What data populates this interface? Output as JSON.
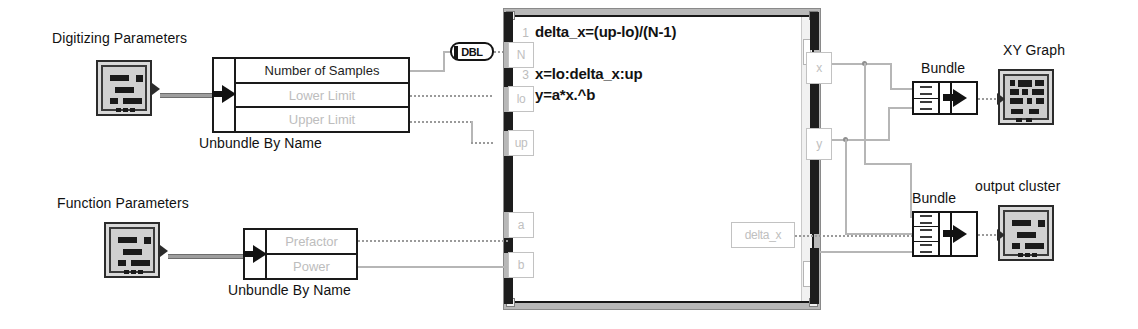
{
  "diagram": {
    "labels": {
      "digitizing_parameters": "Digitizing Parameters",
      "function_parameters": "Function Parameters",
      "unbundle_by_name_1": "Unbundle By Name",
      "unbundle_by_name_2": "Unbundle By Name",
      "bundle_1": "Bundle",
      "bundle_2": "Bundle",
      "xy_graph": "XY Graph",
      "output_cluster": "output cluster"
    },
    "unbundle_top": {
      "items": [
        {
          "label": "Number of Samples",
          "style": "dark"
        },
        {
          "label": "Lower Limit",
          "style": "faint"
        },
        {
          "label": "Upper Limit",
          "style": "faint"
        }
      ]
    },
    "unbundle_bottom": {
      "items": [
        {
          "label": "Prefactor",
          "style": "faint"
        },
        {
          "label": "Power",
          "style": "faint"
        }
      ]
    },
    "conversion_node": {
      "label": "DBL"
    },
    "formula_node": {
      "lines": [
        {
          "num": "1",
          "code": "delta_x=(up-lo)/(N-1)"
        },
        {
          "num": "2",
          "code": ""
        },
        {
          "num": "3",
          "code": "x=lo:delta_x:up"
        },
        {
          "num": "4",
          "code": "y=a*x.^b"
        }
      ],
      "inputs": [
        {
          "name": "N"
        },
        {
          "name": "lo"
        },
        {
          "name": "up"
        },
        {
          "name": "a"
        },
        {
          "name": "b"
        }
      ],
      "outputs": [
        {
          "name": "x"
        },
        {
          "name": "y"
        },
        {
          "name": "delta_x"
        }
      ]
    },
    "colors": {
      "wire": "#b6b6b6",
      "node_border": "#141414",
      "faint_text": "#bdbdbd",
      "frame": "#b8b8b8"
    }
  }
}
